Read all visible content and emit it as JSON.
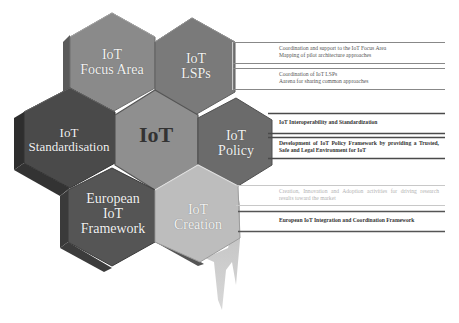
{
  "diagram": {
    "title": "IoT",
    "hexagons": [
      {
        "id": "focus-area",
        "lines": [
          "IoT",
          "Focus Area"
        ],
        "color": "#8a8a8a"
      },
      {
        "id": "lsps",
        "lines": [
          "IoT",
          "LSPs"
        ],
        "color": "#7a7a7a"
      },
      {
        "id": "standardisation",
        "lines": [
          "IoT",
          "Standardisation"
        ],
        "color": "#4a4a4a"
      },
      {
        "id": "center",
        "lines": [
          "IoT"
        ],
        "color": "#8f8f8f"
      },
      {
        "id": "policy",
        "lines": [
          "IoT",
          "Policy"
        ],
        "color": "#6b6b6b"
      },
      {
        "id": "european",
        "lines": [
          "European",
          "IoT",
          "Framework"
        ],
        "color": "#555555"
      },
      {
        "id": "creation",
        "lines": [
          "IoT",
          "Creation"
        ],
        "color": "#bdbdbd"
      }
    ],
    "descriptions": [
      {
        "group": "lsps",
        "text": "Coordination and support to the IoT Focus Area Mapping of pilot architecture approaches",
        "line1": "Coordination and support to the IoT Focus Area",
        "line2": "Mapping of pilot architecture approaches"
      },
      {
        "group": "lsps",
        "text": "Coordination of IoT LSPs Aarena for sharing common approaches",
        "line1": "Coordination of IoT LSPs",
        "line2": "Aarena for sharing common approaches"
      },
      {
        "group": "policy",
        "text": "IoT Interoperability and Standardization"
      },
      {
        "group": "policy",
        "text": "Development of IoT Policy Framework by providing a Trusted, Safe and Legal Environment for IoT"
      },
      {
        "group": "creation",
        "text": "Creation, Innovation and Adoption activities for driving research results toward the market"
      },
      {
        "group": "creation",
        "text": "European IoT Integration and Coordination Framework"
      }
    ],
    "colors": {
      "line_dark": "#555555",
      "line_light": "#bbbbbb",
      "text_dark": "#333333",
      "text_faint": "#b3b3b3"
    }
  }
}
